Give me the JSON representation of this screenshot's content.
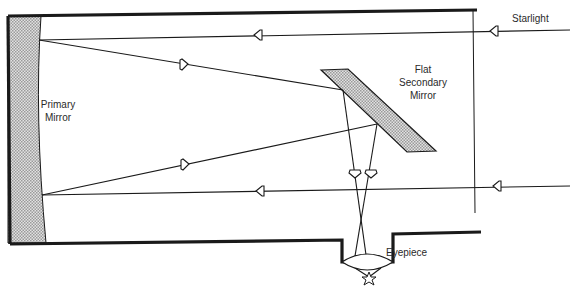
{
  "labels": {
    "primary_mirror": [
      "Primary",
      "Mirror"
    ],
    "secondary_mirror": [
      "Flat",
      "Secondary",
      "Mirror"
    ],
    "starlight": "Starlight",
    "eyepiece": "Eyepiece"
  },
  "components": [
    {
      "name": "tube",
      "type": "telescope-tube"
    },
    {
      "name": "primary-mirror",
      "type": "concave-mirror",
      "fill": "hatched-gray"
    },
    {
      "name": "secondary-mirror",
      "type": "flat-diagonal-mirror",
      "fill": "hatched-gray"
    },
    {
      "name": "eyepiece-lens",
      "type": "convex-lens"
    },
    {
      "name": "image-point",
      "type": "star-icon"
    }
  ],
  "rays": [
    {
      "name": "incoming-ray-top",
      "direction": "leftward",
      "description": "Starlight enters tube, travels to primary mirror"
    },
    {
      "name": "incoming-ray-bottom",
      "direction": "leftward",
      "description": "Starlight enters tube, travels to primary mirror"
    },
    {
      "name": "reflected-ray-top",
      "direction": "rightward",
      "description": "Reflected from primary toward secondary mirror"
    },
    {
      "name": "reflected-ray-bottom",
      "direction": "rightward",
      "description": "Reflected from primary toward secondary mirror"
    },
    {
      "name": "diverted-rays",
      "direction": "downward",
      "description": "Secondary mirror diverts light to eyepiece"
    }
  ],
  "colors": {
    "line": "#1a1a1a",
    "mirror_fill": "#c8c8c8",
    "text": "#2a2a2a",
    "background": "#ffffff"
  }
}
